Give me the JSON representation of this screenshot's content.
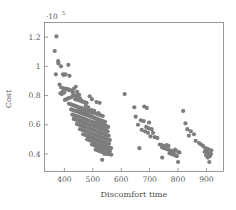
{
  "chart_data": {
    "type": "scatter",
    "title": "",
    "xlabel": "Discomfort time",
    "ylabel": "Cost",
    "y_exponent_label": "·10",
    "y_exponent_power": "5",
    "xlim": [
      330,
      960
    ],
    "ylim": [
      0.28,
      1.3
    ],
    "xticks": [
      400,
      500,
      600,
      700,
      800,
      900
    ],
    "xticklabels": [
      "400",
      "500",
      "600",
      "700",
      "800",
      "900"
    ],
    "yticks": [
      0.4,
      0.6,
      0.8,
      1.0,
      1.2
    ],
    "yticklabels": [
      "0.4",
      "0.6",
      "0.8",
      "1",
      "1.2"
    ],
    "grid": false,
    "legend": false,
    "marker": "circle",
    "marker_color": "#7d7d7d",
    "marker_size": 2.1,
    "series": [
      {
        "name": "solutions",
        "points": [
          [
            372,
            1.205
          ],
          [
            366,
            1.105
          ],
          [
            378,
            1.035
          ],
          [
            379,
            1.02
          ],
          [
            388,
            1.0
          ],
          [
            414,
            1.01
          ],
          [
            370,
            0.945
          ],
          [
            395,
            0.945
          ],
          [
            404,
            0.945
          ],
          [
            398,
            0.94
          ],
          [
            418,
            0.935
          ],
          [
            383,
            0.875
          ],
          [
            389,
            0.855
          ],
          [
            397,
            0.85
          ],
          [
            404,
            0.845
          ],
          [
            408,
            0.845
          ],
          [
            412,
            0.84
          ],
          [
            416,
            0.84
          ],
          [
            394,
            0.825
          ],
          [
            399,
            0.82
          ],
          [
            386,
            0.815
          ],
          [
            391,
            0.81
          ],
          [
            423,
            0.835
          ],
          [
            433,
            0.845
          ],
          [
            440,
            0.86
          ],
          [
            445,
            0.825
          ],
          [
            452,
            0.805
          ],
          [
            431,
            0.8
          ],
          [
            425,
            0.79
          ],
          [
            419,
            0.785
          ],
          [
            413,
            0.78
          ],
          [
            407,
            0.775
          ],
          [
            402,
            0.77
          ],
          [
            438,
            0.775
          ],
          [
            446,
            0.77
          ],
          [
            455,
            0.765
          ],
          [
            463,
            0.76
          ],
          [
            470,
            0.755
          ],
          [
            478,
            0.75
          ],
          [
            489,
            0.795
          ],
          [
            497,
            0.775
          ],
          [
            513,
            0.755
          ],
          [
            524,
            0.75
          ],
          [
            416,
            0.745
          ],
          [
            423,
            0.74
          ],
          [
            430,
            0.735
          ],
          [
            437,
            0.73
          ],
          [
            444,
            0.725
          ],
          [
            451,
            0.72
          ],
          [
            458,
            0.715
          ],
          [
            465,
            0.71
          ],
          [
            472,
            0.705
          ],
          [
            479,
            0.7
          ],
          [
            486,
            0.695
          ],
          [
            493,
            0.69
          ],
          [
            500,
            0.685
          ],
          [
            507,
            0.68
          ],
          [
            514,
            0.675
          ],
          [
            521,
            0.67
          ],
          [
            528,
            0.665
          ],
          [
            535,
            0.66
          ],
          [
            424,
            0.705
          ],
          [
            431,
            0.7
          ],
          [
            438,
            0.695
          ],
          [
            445,
            0.69
          ],
          [
            452,
            0.685
          ],
          [
            459,
            0.68
          ],
          [
            466,
            0.675
          ],
          [
            473,
            0.67
          ],
          [
            480,
            0.665
          ],
          [
            487,
            0.66
          ],
          [
            494,
            0.655
          ],
          [
            501,
            0.65
          ],
          [
            508,
            0.645
          ],
          [
            515,
            0.64
          ],
          [
            522,
            0.635
          ],
          [
            529,
            0.63
          ],
          [
            536,
            0.625
          ],
          [
            543,
            0.62
          ],
          [
            428,
            0.67
          ],
          [
            435,
            0.665
          ],
          [
            442,
            0.66
          ],
          [
            449,
            0.655
          ],
          [
            456,
            0.65
          ],
          [
            463,
            0.645
          ],
          [
            470,
            0.64
          ],
          [
            477,
            0.635
          ],
          [
            484,
            0.63
          ],
          [
            491,
            0.625
          ],
          [
            498,
            0.62
          ],
          [
            505,
            0.615
          ],
          [
            512,
            0.61
          ],
          [
            519,
            0.605
          ],
          [
            526,
            0.6
          ],
          [
            533,
            0.595
          ],
          [
            540,
            0.59
          ],
          [
            547,
            0.585
          ],
          [
            433,
            0.64
          ],
          [
            440,
            0.635
          ],
          [
            447,
            0.63
          ],
          [
            454,
            0.625
          ],
          [
            461,
            0.62
          ],
          [
            468,
            0.615
          ],
          [
            475,
            0.61
          ],
          [
            482,
            0.605
          ],
          [
            489,
            0.6
          ],
          [
            496,
            0.595
          ],
          [
            503,
            0.59
          ],
          [
            510,
            0.585
          ],
          [
            517,
            0.58
          ],
          [
            524,
            0.575
          ],
          [
            531,
            0.57
          ],
          [
            538,
            0.565
          ],
          [
            545,
            0.56
          ],
          [
            552,
            0.555
          ],
          [
            444,
            0.605
          ],
          [
            451,
            0.6
          ],
          [
            458,
            0.595
          ],
          [
            465,
            0.59
          ],
          [
            472,
            0.585
          ],
          [
            479,
            0.58
          ],
          [
            486,
            0.575
          ],
          [
            493,
            0.57
          ],
          [
            500,
            0.565
          ],
          [
            507,
            0.56
          ],
          [
            514,
            0.555
          ],
          [
            521,
            0.55
          ],
          [
            528,
            0.545
          ],
          [
            535,
            0.54
          ],
          [
            542,
            0.535
          ],
          [
            549,
            0.53
          ],
          [
            556,
            0.525
          ],
          [
            455,
            0.57
          ],
          [
            462,
            0.565
          ],
          [
            469,
            0.56
          ],
          [
            476,
            0.555
          ],
          [
            483,
            0.55
          ],
          [
            490,
            0.545
          ],
          [
            497,
            0.54
          ],
          [
            504,
            0.535
          ],
          [
            511,
            0.53
          ],
          [
            518,
            0.525
          ],
          [
            525,
            0.52
          ],
          [
            532,
            0.515
          ],
          [
            539,
            0.51
          ],
          [
            546,
            0.505
          ],
          [
            553,
            0.5
          ],
          [
            560,
            0.495
          ],
          [
            466,
            0.535
          ],
          [
            473,
            0.53
          ],
          [
            480,
            0.525
          ],
          [
            487,
            0.52
          ],
          [
            494,
            0.515
          ],
          [
            501,
            0.51
          ],
          [
            508,
            0.505
          ],
          [
            515,
            0.5
          ],
          [
            522,
            0.495
          ],
          [
            529,
            0.49
          ],
          [
            536,
            0.485
          ],
          [
            543,
            0.48
          ],
          [
            550,
            0.475
          ],
          [
            557,
            0.47
          ],
          [
            480,
            0.5
          ],
          [
            487,
            0.495
          ],
          [
            494,
            0.49
          ],
          [
            501,
            0.485
          ],
          [
            508,
            0.48
          ],
          [
            515,
            0.475
          ],
          [
            522,
            0.47
          ],
          [
            529,
            0.465
          ],
          [
            536,
            0.46
          ],
          [
            543,
            0.455
          ],
          [
            550,
            0.45
          ],
          [
            557,
            0.445
          ],
          [
            564,
            0.44
          ],
          [
            497,
            0.465
          ],
          [
            504,
            0.46
          ],
          [
            511,
            0.455
          ],
          [
            518,
            0.45
          ],
          [
            525,
            0.445
          ],
          [
            532,
            0.44
          ],
          [
            539,
            0.435
          ],
          [
            546,
            0.43
          ],
          [
            553,
            0.425
          ],
          [
            560,
            0.42
          ],
          [
            510,
            0.43
          ],
          [
            517,
            0.425
          ],
          [
            524,
            0.42
          ],
          [
            531,
            0.415
          ],
          [
            538,
            0.41
          ],
          [
            545,
            0.405
          ],
          [
            552,
            0.4
          ],
          [
            559,
            0.398
          ],
          [
            565,
            0.395
          ],
          [
            533,
            0.36
          ],
          [
            541,
            0.4
          ],
          [
            548,
            0.405
          ],
          [
            556,
            0.41
          ],
          [
            475,
            0.73
          ],
          [
            484,
            0.72
          ],
          [
            462,
            0.76
          ],
          [
            496,
            0.7
          ],
          [
            505,
            0.695
          ],
          [
            447,
            0.79
          ],
          [
            455,
            0.78
          ],
          [
            430,
            0.82
          ],
          [
            441,
            0.8
          ],
          [
            520,
            0.68
          ],
          [
            458,
            0.705
          ],
          [
            449,
            0.715
          ],
          [
            442,
            0.725
          ],
          [
            466,
            0.695
          ],
          [
            474,
            0.685
          ],
          [
            482,
            0.675
          ],
          [
            490,
            0.665
          ],
          [
            498,
            0.655
          ],
          [
            506,
            0.645
          ],
          [
            514,
            0.635
          ],
          [
            522,
            0.625
          ],
          [
            530,
            0.615
          ],
          [
            538,
            0.605
          ],
          [
            546,
            0.595
          ],
          [
            554,
            0.585
          ],
          [
            612,
            0.81
          ],
          [
            646,
            0.72
          ],
          [
            681,
            0.725
          ],
          [
            690,
            0.715
          ],
          [
            651,
            0.655
          ],
          [
            669,
            0.63
          ],
          [
            679,
            0.625
          ],
          [
            698,
            0.615
          ],
          [
            688,
            0.585
          ],
          [
            697,
            0.575
          ],
          [
            707,
            0.57
          ],
          [
            659,
            0.6
          ],
          [
            672,
            0.565
          ],
          [
            684,
            0.555
          ],
          [
            694,
            0.545
          ],
          [
            712,
            0.545
          ],
          [
            703,
            0.52
          ],
          [
            718,
            0.515
          ],
          [
            727,
            0.51
          ],
          [
            664,
            0.44
          ],
          [
            736,
            0.465
          ],
          [
            742,
            0.46
          ],
          [
            748,
            0.455
          ],
          [
            754,
            0.45
          ],
          [
            760,
            0.46
          ],
          [
            766,
            0.455
          ],
          [
            744,
            0.445
          ],
          [
            751,
            0.44
          ],
          [
            758,
            0.435
          ],
          [
            765,
            0.43
          ],
          [
            772,
            0.425
          ],
          [
            779,
            0.42
          ],
          [
            786,
            0.415
          ],
          [
            770,
            0.405
          ],
          [
            777,
            0.4
          ],
          [
            784,
            0.395
          ],
          [
            791,
            0.39
          ],
          [
            796,
            0.385
          ],
          [
            744,
            0.375
          ],
          [
            790,
            0.43
          ],
          [
            800,
            0.415
          ],
          [
            805,
            0.41
          ],
          [
            800,
            0.345
          ],
          [
            818,
            0.695
          ],
          [
            826,
            0.61
          ],
          [
            833,
            0.57
          ],
          [
            845,
            0.555
          ],
          [
            856,
            0.535
          ],
          [
            838,
            0.525
          ],
          [
            862,
            0.49
          ],
          [
            874,
            0.475
          ],
          [
            881,
            0.465
          ],
          [
            888,
            0.455
          ],
          [
            896,
            0.44
          ],
          [
            903,
            0.435
          ],
          [
            908,
            0.43
          ],
          [
            901,
            0.42
          ],
          [
            894,
            0.415
          ],
          [
            910,
            0.405
          ],
          [
            916,
            0.4
          ],
          [
            906,
            0.395
          ],
          [
            899,
            0.39
          ],
          [
            912,
            0.385
          ],
          [
            905,
            0.375
          ],
          [
            917,
            0.425
          ],
          [
            910,
            0.345
          ]
        ]
      }
    ]
  }
}
